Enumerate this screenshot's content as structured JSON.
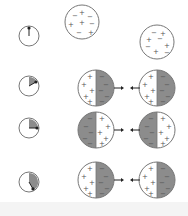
{
  "colors": {
    "stroke": "#777777",
    "shade": "#8c8c8c",
    "fill": "#ffffff",
    "sign": "#555555",
    "hand": "#222222",
    "bottom_strip": "#f4f4f4"
  },
  "top_spheres": [
    {
      "cx": 82,
      "cy": 22,
      "r": 17,
      "signs": [
        {
          "s": "−",
          "x": -7,
          "y": -7
        },
        {
          "s": "+",
          "x": 0,
          "y": -10
        },
        {
          "s": "−",
          "x": 8,
          "y": -6
        },
        {
          "s": "+",
          "x": -11,
          "y": 2
        },
        {
          "s": "+",
          "x": 0,
          "y": 0
        },
        {
          "s": "−",
          "x": 10,
          "y": 1
        },
        {
          "s": "−",
          "x": -3,
          "y": 10
        },
        {
          "s": "+",
          "x": 9,
          "y": 10
        }
      ]
    },
    {
      "cx": 157,
      "cy": 42,
      "r": 17,
      "signs": [
        {
          "s": "−",
          "x": -3,
          "y": -10
        },
        {
          "s": "+",
          "x": 6,
          "y": -9
        },
        {
          "s": "+",
          "x": -8,
          "y": -3
        },
        {
          "s": "−",
          "x": 3,
          "y": -4
        },
        {
          "s": "−",
          "x": -9,
          "y": 4
        },
        {
          "s": "+",
          "x": 10,
          "y": 3
        },
        {
          "s": "+",
          "x": -1,
          "y": 9
        },
        {
          "s": "−",
          "x": 10,
          "y": 10
        }
      ]
    }
  ],
  "clocks": [
    {
      "cx": 29,
      "cy": 36,
      "r": 10,
      "angle": 0
    },
    {
      "cx": 29,
      "cy": 86,
      "r": 10,
      "angle": 60
    },
    {
      "cx": 29,
      "cy": 128,
      "r": 10,
      "angle": 90
    },
    {
      "cx": 29,
      "cy": 182,
      "r": 10,
      "angle": 150
    }
  ],
  "rows": [
    {
      "cy": 88,
      "left": {
        "cx": 96,
        "shaded": "right"
      },
      "right": {
        "cx": 157,
        "shaded": "right"
      }
    },
    {
      "cy": 130,
      "left": {
        "cx": 96,
        "shaded": "left"
      },
      "right": {
        "cx": 157,
        "shaded": "left"
      }
    },
    {
      "cy": 180,
      "left": {
        "cx": 96,
        "shaded": "right"
      },
      "right": {
        "cx": 157,
        "shaded": "right"
      }
    }
  ],
  "split_radius": 18,
  "arrow": {
    "left_from": 114,
    "left_to": 122,
    "right_from": 140,
    "right_to": 132
  },
  "signs": {
    "plus": "+",
    "minus": "−"
  }
}
